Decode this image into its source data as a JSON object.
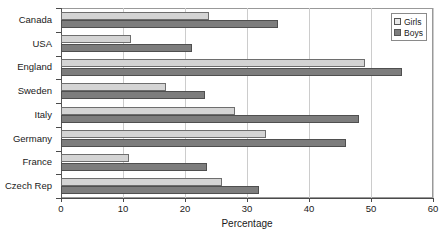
{
  "chart_data": {
    "type": "bar",
    "orientation": "horizontal",
    "title": "",
    "xlabel": "Percentage",
    "ylabel": "",
    "xlim": [
      0,
      60
    ],
    "xticks": [
      0,
      10,
      20,
      30,
      40,
      50,
      60
    ],
    "grid": true,
    "legend_position": "top-right",
    "categories": [
      "Canada",
      "USA",
      "England",
      "Sweden",
      "Italy",
      "Germany",
      "France",
      "Czech Rep"
    ],
    "series": [
      {
        "name": "Girls",
        "color": "#d4d4d4",
        "values": [
          23.8,
          11.3,
          49.0,
          17.0,
          28.0,
          33.0,
          11.0,
          26.0
        ]
      },
      {
        "name": "Boys",
        "color": "#7d7d7d",
        "values": [
          35.0,
          21.2,
          55.0,
          23.3,
          48.0,
          46.0,
          23.5,
          32.0
        ]
      }
    ]
  },
  "legend": {
    "items": [
      {
        "label": "Girls",
        "swatch": "girls"
      },
      {
        "label": "Boys",
        "swatch": "boys"
      }
    ]
  }
}
